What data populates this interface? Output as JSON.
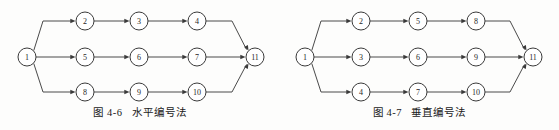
{
  "page": {
    "background": "#fdfdfc",
    "width": 559,
    "height": 130
  },
  "style": {
    "node_radius": 9,
    "node_stroke": "#3a3a3a",
    "node_fill": "#ffffff",
    "edge_stroke": "#4a4a4a",
    "label_color": "#1f1f1f"
  },
  "figures": [
    {
      "id": "figure-left",
      "origin_x": 0,
      "caption": {
        "number": "图 4-6",
        "title": "水平编号法"
      },
      "diagram": {
        "name": "horizontal-numbering-network",
        "start_node": "1",
        "end_node": "11",
        "rows": [
          {
            "name": "top-row",
            "y": 21,
            "nodes": [
              "2",
              "3",
              "4"
            ]
          },
          {
            "name": "middle-row",
            "y": 57,
            "nodes": [
              "5",
              "6",
              "7"
            ]
          },
          {
            "name": "bottom-row",
            "y": 92,
            "nodes": [
              "8",
              "9",
              "10"
            ]
          }
        ],
        "columns_x": [
          85,
          139,
          197
        ],
        "start_x": 27,
        "end_x": 255,
        "branch_x": 43,
        "merge_x": 232
      }
    },
    {
      "id": "figure-right",
      "origin_x": 280,
      "caption": {
        "number": "图 4-7",
        "title": "垂直编号法"
      },
      "diagram": {
        "name": "vertical-numbering-network",
        "start_node": "1",
        "end_node": "11",
        "rows": [
          {
            "name": "top-row",
            "y": 21,
            "nodes": [
              "2",
              "5",
              "8"
            ]
          },
          {
            "name": "middle-row",
            "y": 57,
            "nodes": [
              "3",
              "6",
              "9"
            ]
          },
          {
            "name": "bottom-row",
            "y": 92,
            "nodes": [
              "4",
              "7",
              "10"
            ]
          }
        ],
        "columns_x": [
          81,
          138,
          196
        ],
        "start_x": 25,
        "end_x": 253,
        "branch_x": 41,
        "merge_x": 230
      }
    }
  ]
}
